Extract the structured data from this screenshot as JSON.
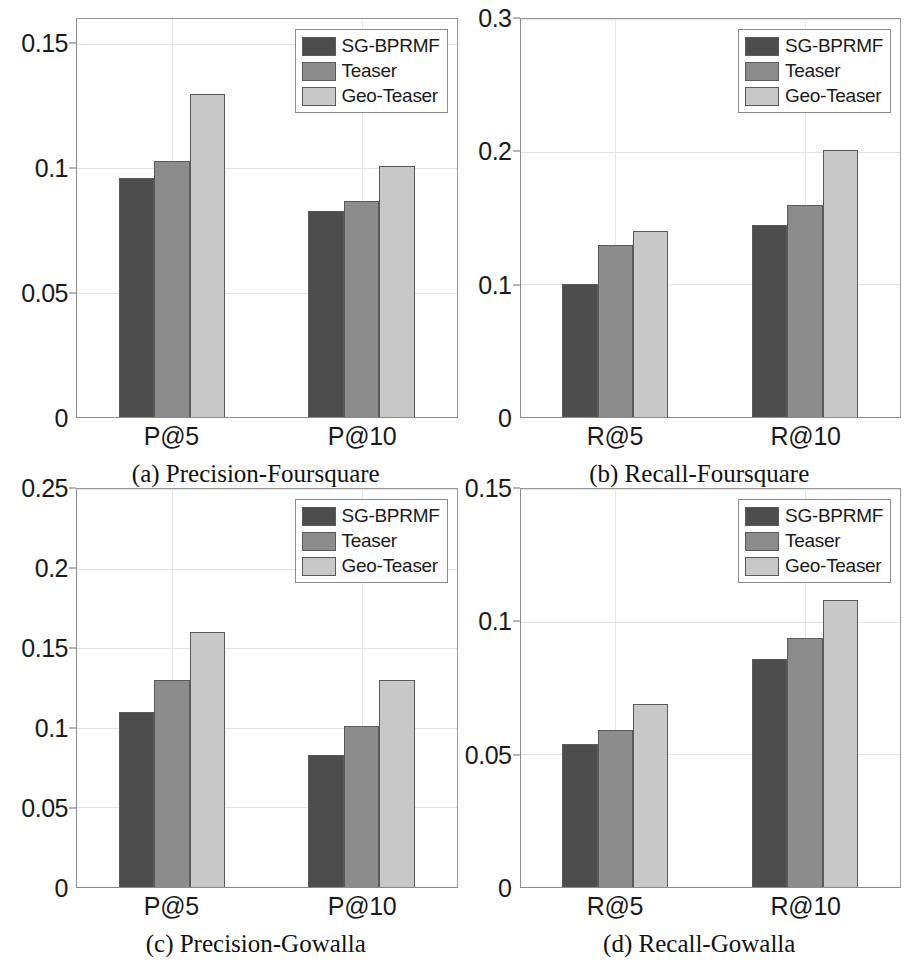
{
  "figure": {
    "series_colors": {
      "sg_bprmf": "#4d4d4d",
      "teaser": "#8c8c8c",
      "geo_teaser": "#c8c8c8"
    },
    "legend_labels": [
      "SG-BPRMF",
      "Teaser",
      "Geo-Teaser"
    ]
  },
  "chart_data": [
    {
      "type": "bar",
      "panel_id": "a",
      "title": "(a) Precision-Foursquare",
      "xlabel": "",
      "ylabel": "",
      "categories": [
        "P@5",
        "P@10"
      ],
      "series": [
        {
          "name": "SG-BPRMF",
          "color": "#4d4d4d",
          "values": [
            0.096,
            0.083
          ]
        },
        {
          "name": "Teaser",
          "color": "#8c8c8c",
          "values": [
            0.103,
            0.087
          ]
        },
        {
          "name": "Geo-Teaser",
          "color": "#c8c8c8",
          "values": [
            0.13,
            0.101
          ]
        }
      ],
      "ylim": [
        0,
        0.16
      ],
      "yticks": [
        0,
        0.05,
        0.1,
        0.15
      ],
      "ytick_labels": [
        "0",
        "0.05",
        "0.1",
        "0.15"
      ],
      "grid": true,
      "legend_position": "top-right"
    },
    {
      "type": "bar",
      "panel_id": "b",
      "title": "(b) Recall-Foursquare",
      "xlabel": "",
      "ylabel": "",
      "categories": [
        "R@5",
        "R@10"
      ],
      "series": [
        {
          "name": "SG-BPRMF",
          "color": "#4d4d4d",
          "values": [
            0.1,
            0.145
          ]
        },
        {
          "name": "Teaser",
          "color": "#8c8c8c",
          "values": [
            0.13,
            0.16
          ]
        },
        {
          "name": "Geo-Teaser",
          "color": "#c8c8c8",
          "values": [
            0.14,
            0.201
          ]
        }
      ],
      "ylim": [
        0,
        0.3
      ],
      "yticks": [
        0,
        0.1,
        0.2,
        0.3
      ],
      "ytick_labels": [
        "0",
        "0.1",
        "0.2",
        "0.3"
      ],
      "grid": true,
      "legend_position": "top-right"
    },
    {
      "type": "bar",
      "panel_id": "c",
      "title": "(c) Precision-Gowalla",
      "xlabel": "",
      "ylabel": "",
      "categories": [
        "P@5",
        "P@10"
      ],
      "series": [
        {
          "name": "SG-BPRMF",
          "color": "#4d4d4d",
          "values": [
            0.11,
            0.083
          ]
        },
        {
          "name": "Teaser",
          "color": "#8c8c8c",
          "values": [
            0.13,
            0.101
          ]
        },
        {
          "name": "Geo-Teaser",
          "color": "#c8c8c8",
          "values": [
            0.16,
            0.13
          ]
        }
      ],
      "ylim": [
        0,
        0.25
      ],
      "yticks": [
        0,
        0.05,
        0.1,
        0.15,
        0.2,
        0.25
      ],
      "ytick_labels": [
        "0",
        "0.05",
        "0.1",
        "0.15",
        "0.2",
        "0.25"
      ],
      "grid": true,
      "legend_position": "top-right"
    },
    {
      "type": "bar",
      "panel_id": "d",
      "title": "(d) Recall-Gowalla",
      "xlabel": "",
      "ylabel": "",
      "categories": [
        "R@5",
        "R@10"
      ],
      "series": [
        {
          "name": "SG-BPRMF",
          "color": "#4d4d4d",
          "values": [
            0.054,
            0.086
          ]
        },
        {
          "name": "Teaser",
          "color": "#8c8c8c",
          "values": [
            0.059,
            0.094
          ]
        },
        {
          "name": "Geo-Teaser",
          "color": "#c8c8c8",
          "values": [
            0.069,
            0.108
          ]
        }
      ],
      "ylim": [
        0,
        0.15
      ],
      "yticks": [
        0,
        0.05,
        0.1,
        0.15
      ],
      "ytick_labels": [
        "0",
        "0.05",
        "0.1",
        "0.15"
      ],
      "grid": true,
      "legend_position": "top-right"
    }
  ]
}
